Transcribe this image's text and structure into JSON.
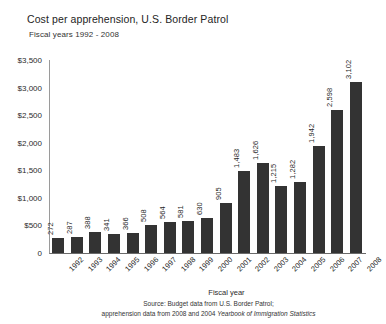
{
  "title": "Cost per apprehension, U.S. Border Patrol",
  "subtitle": "Fiscal years 1992 - 2008",
  "footer": {
    "x_axis_title": "Fiscal year",
    "source_line_1": "Source: Budget data from U.S. Border Patrol;",
    "source_line_2_prefix": "apprehension data from 2008 and 2004 ",
    "source_line_2_italic": "Yearbook of Immigration Statistics"
  },
  "colors": {
    "bar": "#333333",
    "axis": "#6a6a6a",
    "text": "#1f1f1f",
    "background": "#ffffff"
  },
  "chart_data": {
    "type": "bar",
    "title": "Cost per apprehension, U.S. Border Patrol",
    "subtitle": "Fiscal years 1992 - 2008",
    "xlabel": "Fiscal year",
    "ylabel": "",
    "ylim": [
      0,
      3500
    ],
    "ytick_values": [
      0,
      500,
      1000,
      1500,
      2000,
      2500,
      3000,
      3500
    ],
    "ytick_labels": [
      "0",
      "$500",
      "$1,000",
      "$1,500",
      "$2,000",
      "$2,500",
      "$3,000",
      "$3,500"
    ],
    "grid": false,
    "legend": false,
    "categories": [
      "1992",
      "1993",
      "1994",
      "1995",
      "1996",
      "1997",
      "1998",
      "1999",
      "2000",
      "2001",
      "2002",
      "2003",
      "2004",
      "2005",
      "2006",
      "2007",
      "2008"
    ],
    "values": [
      272,
      287,
      388,
      341,
      366,
      508,
      564,
      581,
      630,
      905,
      1483,
      1626,
      1215,
      1282,
      1942,
      2598,
      3102
    ],
    "value_labels": [
      "272",
      "287",
      "388",
      "341",
      "366",
      "508",
      "564",
      "581",
      "630",
      "905",
      "1,483",
      "1,626",
      "1,215",
      "1,282",
      "1,942",
      "2,598",
      "3,102"
    ]
  }
}
